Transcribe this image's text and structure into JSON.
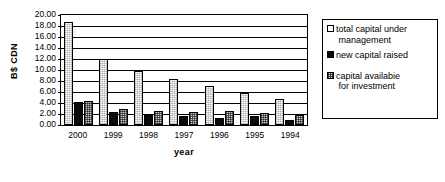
{
  "chart_data": {
    "type": "bar",
    "title": "",
    "xlabel": "year",
    "ylabel": "B$ CDN",
    "ylim": [
      0,
      20
    ],
    "ytick_step": 2,
    "grid": true,
    "legend_position": "right",
    "categories": [
      "2000",
      "1999",
      "1998",
      "1997",
      "1996",
      "1995",
      "1994"
    ],
    "yticks": [
      "20.00",
      "18.00",
      "16.00",
      "14.00",
      "12.00",
      "10.00",
      "8.00",
      "6.00",
      "4.00",
      "2.00",
      "0.00"
    ],
    "series": [
      {
        "name": "total capital under management",
        "legend_label_line1": "total capital under",
        "legend_label_line2": "management",
        "swatch": "white-outline",
        "values": [
          18.8,
          12.0,
          9.9,
          8.4,
          7.1,
          5.9,
          4.8
        ]
      },
      {
        "name": "new capital raised",
        "legend_label_line1": "new capital raised",
        "legend_label_line2": "",
        "swatch": "solid-black",
        "values": [
          4.1,
          2.4,
          2.0,
          1.6,
          1.2,
          1.7,
          1.0
        ]
      },
      {
        "name": "capital availabie for investment",
        "legend_label_line1": "capital availabie",
        "legend_label_line2": "for investment",
        "swatch": "gray-checker",
        "values": [
          4.4,
          2.9,
          2.5,
          2.3,
          2.5,
          2.2,
          1.9
        ]
      }
    ]
  },
  "colors": {
    "axis": "#000000",
    "series_total": "#ffffff",
    "series_new": "#0a0a0a",
    "series_available": "#c9c9c9",
    "background": "#ffffff"
  }
}
